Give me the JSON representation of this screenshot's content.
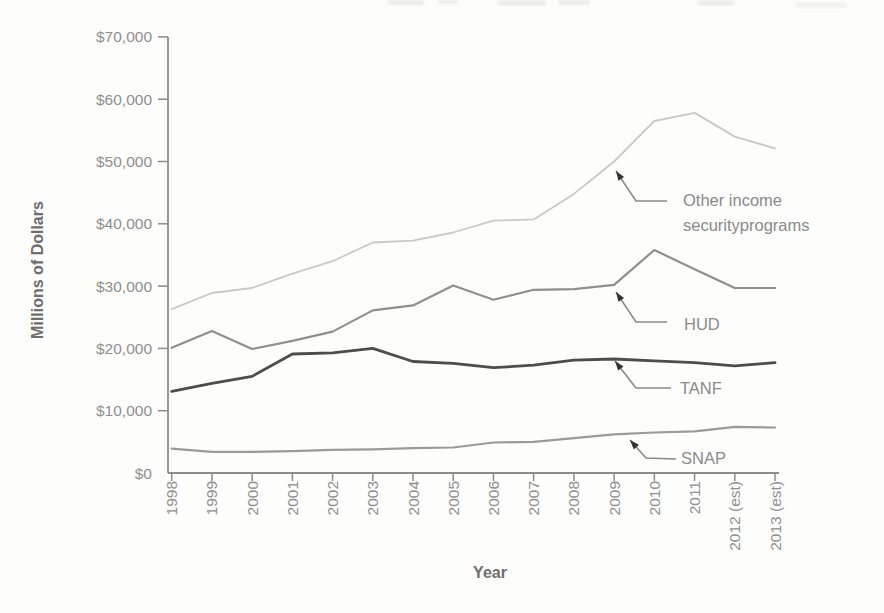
{
  "page": {
    "background_color": "#fdfdfb",
    "style": "scanned textbook line chart, grayscale"
  },
  "chart_data": {
    "type": "line",
    "title": "",
    "xlabel": "Year",
    "ylabel": "Millions of Dollars",
    "categories": [
      "1998",
      "1999",
      "2000",
      "2001",
      "2002",
      "2003",
      "2004",
      "2005",
      "2006",
      "2007",
      "2008",
      "2009",
      "2010",
      "2011",
      "2012 (est)",
      "2013 (est)"
    ],
    "y_axis": {
      "min": 0,
      "max": 70000,
      "tick_interval": 10000,
      "tick_labels": [
        "$0",
        "$10,000",
        "$20,000",
        "$30,000",
        "$40,000",
        "$50,000",
        "$60,000",
        "$70,000"
      ]
    },
    "grid": false,
    "legend_style": "arrow-callout-annotations",
    "axis_color": "#8c8c8c",
    "tick_label_color": "#8f8f8f",
    "axis_title_color": "#6e6e6e",
    "annotation_text_color": "#8a8a8a",
    "arrowhead_color": "#333333",
    "series": [
      {
        "id": "other",
        "name": "Other income securityprograms",
        "color": "#c9c9c9",
        "width": 1.8,
        "values": [
          26300,
          28900,
          29700,
          32000,
          34000,
          37000,
          37300,
          38600,
          40500,
          40700,
          44800,
          50000,
          56500,
          57800,
          54000,
          52100
        ]
      },
      {
        "id": "hud",
        "name": "HUD",
        "color": "#8f8f8f",
        "width": 2.2,
        "values": [
          20100,
          22800,
          19900,
          21200,
          22700,
          26100,
          26900,
          30100,
          27800,
          29400,
          29500,
          30200,
          35800,
          32700,
          29700,
          29700
        ]
      },
      {
        "id": "tanf",
        "name": "TANF",
        "color": "#4d4d4d",
        "width": 2.8,
        "values": [
          13100,
          14400,
          15500,
          19100,
          19300,
          20000,
          17900,
          17600,
          16900,
          17300,
          18100,
          18300,
          18000,
          17700,
          17200,
          17700
        ]
      },
      {
        "id": "snap",
        "name": "SNAP",
        "color": "#9a9a9a",
        "width": 2.2,
        "values": [
          3900,
          3400,
          3400,
          3500,
          3700,
          3800,
          4000,
          4100,
          4900,
          5000,
          5600,
          6200,
          6500,
          6700,
          7400,
          7300
        ]
      }
    ],
    "annotations": [
      {
        "id": "other",
        "lines": [
          "Other income",
          "securityprograms"
        ]
      },
      {
        "id": "hud",
        "lines": [
          "HUD"
        ]
      },
      {
        "id": "tanf",
        "lines": [
          "TANF"
        ]
      },
      {
        "id": "snap",
        "lines": [
          "SNAP"
        ]
      }
    ]
  }
}
